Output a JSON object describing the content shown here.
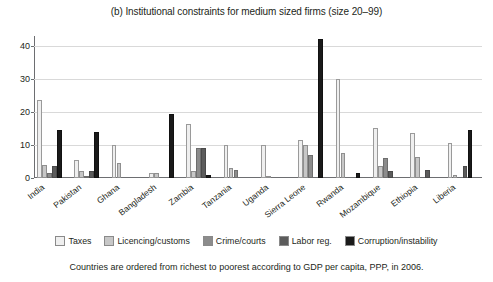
{
  "chart_data": {
    "type": "bar",
    "title": "(b) Institutional constraints for medium sized firms (size 20–99)",
    "xlabel": "",
    "ylabel": "",
    "ylim": [
      0,
      43
    ],
    "yticks": [
      0,
      10,
      20,
      30,
      40
    ],
    "ytick_labels": [
      "0",
      "10",
      "20",
      "30",
      "40"
    ],
    "grid": true,
    "legend_position": "bottom",
    "categories": [
      "India",
      "Pakistan",
      "Ghana",
      "Bangladesh",
      "Zambia",
      "Tanzania",
      "Uganda",
      "Sierra Leone",
      "Rwanda",
      "Mozambique",
      "Ethiopia",
      "Liberia"
    ],
    "series": [
      {
        "name": "Taxes",
        "color": "#efefef",
        "values": [
          23.5,
          5.5,
          10.0,
          1.5,
          16.5,
          10.0,
          10.0,
          11.5,
          30.0,
          15.0,
          13.5,
          10.5
        ]
      },
      {
        "name": "Licencing/customs",
        "color": "#c7c7c7",
        "values": [
          4.0,
          2.0,
          4.5,
          1.5,
          2.0,
          3.0,
          0.5,
          10.0,
          7.5,
          3.5,
          6.5,
          1.0
        ]
      },
      {
        "name": "Crime/courts",
        "color": "#8c8c8c",
        "values": [
          1.5,
          0.5,
          0.0,
          0.0,
          9.0,
          2.5,
          0.0,
          7.0,
          0.0,
          6.0,
          0.0,
          0.0
        ]
      },
      {
        "name": "Labor reg.",
        "color": "#5c5c5c",
        "values": [
          3.5,
          2.0,
          0.0,
          0.0,
          9.0,
          0.0,
          0.0,
          0.0,
          0.0,
          2.0,
          2.5,
          3.5
        ]
      },
      {
        "name": "Corruption/instability",
        "color": "#1a1a1a",
        "values": [
          14.5,
          14.0,
          0.0,
          19.5,
          1.0,
          0.0,
          0.0,
          42.0,
          1.5,
          0.0,
          0.0,
          14.5
        ]
      }
    ],
    "footnote": "Countries are ordered from richest to poorest according to GDP per capita, PPP, in 2006."
  }
}
